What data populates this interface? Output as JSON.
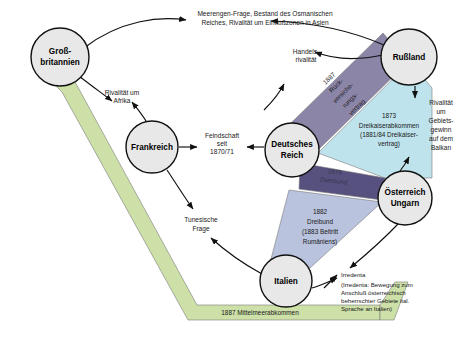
{
  "diagram": {
    "colors": {
      "node_fill": "#e8e8e8",
      "node_stroke": "#111111",
      "reinsurance_band": "#8b85a8",
      "three_emperors_band": "#bfe3ec",
      "dual_alliance_band": "#56517e",
      "triple_alliance_band": "#b9c3dd",
      "mediterranean_band": "#cde0a8",
      "text": "#1a1a1a"
    },
    "nodes": [
      {
        "id": "grossbritannien",
        "label_line1": "Groß-",
        "label_line2": "britannien",
        "cx": 60,
        "cy": 57,
        "r": 29
      },
      {
        "id": "russland",
        "label_line1": "Rußland",
        "label_line2": "",
        "cx": 409,
        "cy": 57,
        "r": 28
      },
      {
        "id": "frankreich",
        "label_line1": "Frankreich",
        "label_line2": "",
        "cx": 152,
        "cy": 147,
        "r": 26
      },
      {
        "id": "deutsches-reich",
        "label_line1": "Deutsches",
        "label_line2": "Reich",
        "cx": 292,
        "cy": 150,
        "r": 27
      },
      {
        "id": "oesterreich-ungarn",
        "label_line1": "Österreich",
        "label_line2": "Ungarn",
        "cx": 405,
        "cy": 198,
        "r": 27
      },
      {
        "id": "italien",
        "label_line1": "Italien",
        "label_line2": "",
        "cx": 286,
        "cy": 281,
        "r": 26
      }
    ],
    "treaty_bands": [
      {
        "id": "rueckversicherungsvertrag",
        "lines": [
          "1887",
          "Rück-",
          "versiche-",
          "rungs-",
          "vertrag"
        ],
        "color": "#8b85a8"
      },
      {
        "id": "dreikaiserabkommen",
        "lines": [
          "1873",
          "Dreikaiserabkommen",
          "(1881/84 Dreikaiser-",
          "vertrag)"
        ],
        "color": "#bfe3ec"
      },
      {
        "id": "zweibund",
        "lines": [
          "1879",
          "Zweibund"
        ],
        "color": "#56517e"
      },
      {
        "id": "dreibund",
        "lines": [
          "1882",
          "Dreibund",
          "(1883 Beitritt",
          "Rumäniens)"
        ],
        "color": "#b9c3dd"
      },
      {
        "id": "mittelmeerabkommen",
        "lines": [
          "1887 Mittelmeerabkommen"
        ],
        "color": "#cde0a8"
      }
    ],
    "annotations": [
      {
        "id": "meerengen-frage",
        "lines": [
          "Meerengen-Frage, Bestand des Osmanischen",
          "Reiches, Rivalität um Einflußzonen in Asien"
        ]
      },
      {
        "id": "handelsrivalitaet",
        "lines": [
          "Handels-",
          "rivalität"
        ]
      },
      {
        "id": "rivalitaet-afrika",
        "lines": [
          "Rivalität um",
          "Afrika"
        ]
      },
      {
        "id": "feindschaft-1870",
        "lines": [
          "Feindschaft",
          "seit",
          "1870/71"
        ]
      },
      {
        "id": "tunesische-frage",
        "lines": [
          "Tunesische",
          "Frage"
        ]
      },
      {
        "id": "rivalitaet-balkan",
        "lines": [
          "Rivalität",
          "um",
          "Gebiets-",
          "gewinn",
          "auf dem",
          "Balkan"
        ]
      },
      {
        "id": "irredenta-title",
        "lines": [
          "Irredenta"
        ]
      },
      {
        "id": "irredenta-note",
        "lines": [
          "(Irredenta: Bewegung zum",
          "Anschluß österreichisch",
          "beherrschter Gebiete ital.",
          "Sprache an Italien)"
        ]
      }
    ]
  }
}
